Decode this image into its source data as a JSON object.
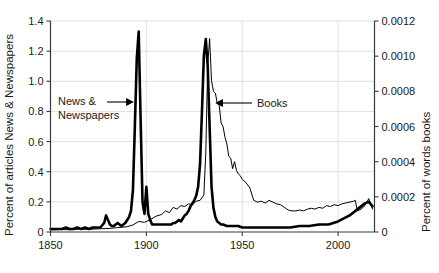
{
  "chart_data": {
    "type": "line",
    "title": "",
    "xlabel": "",
    "ylabel": "Percent of articles News & Newspapers",
    "ylabel_right": "Percent of words books",
    "xlim": [
      1850,
      2019
    ],
    "ylim": [
      0,
      1.4
    ],
    "ylim_right": [
      0,
      0.0012
    ],
    "grid": true,
    "legend_position": "inline-annotations",
    "x_ticks": [
      "1850",
      "1900",
      "1950",
      "2000"
    ],
    "x_tick_values": [
      1850,
      1900,
      1950,
      2000
    ],
    "y_ticks_left": [
      "0",
      "0.2",
      "0.4",
      "0.6",
      "0.8",
      "1.0",
      "1.2",
      "1.4"
    ],
    "y_tick_values_left": [
      0,
      0.2,
      0.4,
      0.6,
      0.8,
      1.0,
      1.2,
      1.4
    ],
    "y_ticks_right": [
      "0",
      "0.0002",
      "0.0004",
      "0.0006",
      "0.0008",
      "0.0010",
      "0.0012"
    ],
    "y_tick_values_right": [
      0,
      0.0002,
      0.0004,
      0.0006,
      0.0008,
      0.001,
      0.0012
    ],
    "annotations": [
      {
        "text": "News & Newspapers",
        "line1": "News &",
        "line2": "Newspapers",
        "points_to_year": 1896,
        "axis": "left"
      },
      {
        "text": "Books",
        "line1": "Books",
        "line2": "",
        "points_to_year": 1935,
        "axis": "right"
      }
    ],
    "series": [
      {
        "name": "News & Newspapers",
        "axis": "left",
        "units": "percent of articles",
        "style": "thick",
        "x": [
          1850,
          1852,
          1854,
          1856,
          1858,
          1860,
          1862,
          1864,
          1866,
          1868,
          1870,
          1872,
          1874,
          1876,
          1878,
          1879,
          1880,
          1881,
          1882,
          1883,
          1884,
          1885,
          1886,
          1887,
          1888,
          1889,
          1890,
          1891,
          1892,
          1893,
          1894,
          1895,
          1896,
          1897,
          1898,
          1899,
          1900,
          1901,
          1902,
          1903,
          1904,
          1905,
          1906,
          1907,
          1908,
          1909,
          1910,
          1911,
          1912,
          1913,
          1914,
          1915,
          1916,
          1917,
          1918,
          1919,
          1920,
          1921,
          1922,
          1923,
          1924,
          1925,
          1926,
          1927,
          1928,
          1929,
          1930,
          1931,
          1932,
          1933,
          1934,
          1935,
          1936,
          1937,
          1938,
          1939,
          1940,
          1942,
          1944,
          1946,
          1948,
          1950,
          1955,
          1960,
          1965,
          1970,
          1975,
          1980,
          1985,
          1990,
          1995,
          2000,
          2003,
          2006,
          2008,
          2010,
          2012,
          2014,
          2016,
          2018
        ],
        "y": [
          0.02,
          0.02,
          0.02,
          0.02,
          0.03,
          0.02,
          0.02,
          0.03,
          0.02,
          0.03,
          0.02,
          0.03,
          0.03,
          0.03,
          0.06,
          0.11,
          0.08,
          0.05,
          0.04,
          0.04,
          0.05,
          0.06,
          0.05,
          0.04,
          0.05,
          0.06,
          0.08,
          0.1,
          0.14,
          0.28,
          0.7,
          1.15,
          1.33,
          0.75,
          0.2,
          0.12,
          0.3,
          0.12,
          0.08,
          0.05,
          0.05,
          0.05,
          0.05,
          0.05,
          0.05,
          0.05,
          0.05,
          0.05,
          0.05,
          0.05,
          0.06,
          0.06,
          0.07,
          0.08,
          0.07,
          0.09,
          0.11,
          0.12,
          0.14,
          0.17,
          0.19,
          0.21,
          0.24,
          0.3,
          0.45,
          0.8,
          1.17,
          1.28,
          1.1,
          0.7,
          0.3,
          0.16,
          0.1,
          0.07,
          0.06,
          0.05,
          0.05,
          0.04,
          0.04,
          0.04,
          0.04,
          0.03,
          0.03,
          0.03,
          0.03,
          0.03,
          0.03,
          0.04,
          0.04,
          0.05,
          0.05,
          0.07,
          0.09,
          0.11,
          0.13,
          0.15,
          0.17,
          0.19,
          0.2,
          0.17
        ]
      },
      {
        "name": "Books",
        "axis": "right",
        "units": "percent of words",
        "style": "thin",
        "x": [
          1850,
          1855,
          1860,
          1865,
          1870,
          1875,
          1880,
          1885,
          1890,
          1893,
          1896,
          1899,
          1902,
          1905,
          1908,
          1910,
          1912,
          1914,
          1916,
          1918,
          1920,
          1922,
          1924,
          1926,
          1928,
          1930,
          1931,
          1932,
          1933,
          1934,
          1935,
          1936,
          1937,
          1938,
          1939,
          1940,
          1941,
          1942,
          1943,
          1944,
          1945,
          1946,
          1947,
          1948,
          1949,
          1950,
          1952,
          1954,
          1956,
          1958,
          1960,
          1962,
          1964,
          1966,
          1968,
          1970,
          1972,
          1974,
          1976,
          1978,
          1980,
          1982,
          1984,
          1986,
          1988,
          1990,
          1992,
          1994,
          1996,
          1998,
          2000,
          2002,
          2004,
          2006,
          2008,
          2009,
          2010,
          2012,
          2014,
          2016,
          2018
        ],
        "y": [
          1.2e-05,
          1.4e-05,
          1.3e-05,
          1.6e-05,
          1.5e-05,
          1.8e-05,
          2e-05,
          2.5e-05,
          3e-05,
          4e-05,
          6e-05,
          5.5e-05,
          7e-05,
          9e-05,
          0.0001,
          0.00012,
          0.00011,
          0.00014,
          0.00013,
          0.00015,
          0.000145,
          0.00016,
          0.000155,
          0.000175,
          0.00018,
          0.00021,
          0.00045,
          0.00095,
          0.0011,
          0.00086,
          0.0008,
          0.00079,
          0.00073,
          0.00072,
          0.00062,
          0.0006,
          0.00054,
          0.0005,
          0.00043,
          0.00042,
          0.00036,
          0.0004,
          0.00035,
          0.00033,
          0.00032,
          0.0003,
          0.00028,
          0.00025,
          0.00018,
          0.00017,
          0.000175,
          0.000165,
          0.00018,
          0.00017,
          0.00016,
          0.000155,
          0.00014,
          0.000125,
          0.00012,
          0.00012,
          0.000125,
          0.00012,
          0.00013,
          0.000135,
          0.00013,
          0.00014,
          0.000135,
          0.00015,
          0.000145,
          0.000155,
          0.00015,
          0.00016,
          0.000165,
          0.00017,
          0.000175,
          0.00018,
          0.00012,
          0.00013,
          0.00015,
          0.00019,
          0.00013
        ]
      }
    ]
  },
  "axes": {
    "left_title": "Percent of articles News & Newspapers",
    "right_title": "Percent of words books"
  }
}
